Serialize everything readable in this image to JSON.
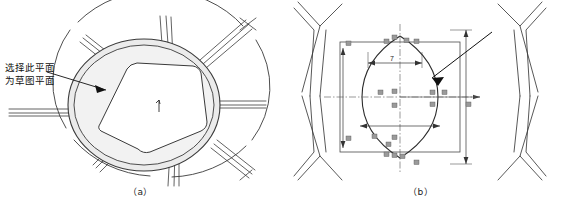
{
  "figure": {
    "panels": [
      {
        "id": "a",
        "caption": "（a）",
        "annotation": "选择此平面\n为草图平面",
        "description": "wheel-hub-3d-model-with-highlighted-face"
      },
      {
        "id": "b",
        "caption": "（b）",
        "annotation": "创建的草图",
        "description": "sketch-with-dimensions-on-wheel-hub",
        "dimensions": [
          "7"
        ]
      }
    ]
  },
  "colors": {
    "line": "#3a3a3a",
    "highlight_fill": "#ebebeb",
    "background": "#ffffff",
    "text": "#111111"
  }
}
